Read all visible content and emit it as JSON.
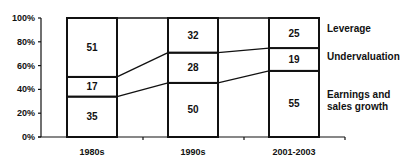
{
  "chart_data": {
    "type": "bar",
    "stacked": true,
    "percent": true,
    "title": "",
    "xlabel": "",
    "ylabel": "",
    "ylim": [
      0,
      100
    ],
    "yticks": [
      "0%",
      "20%",
      "40%",
      "60%",
      "80%",
      "100%"
    ],
    "categories": [
      "1980s",
      "1990s",
      "2001-2003"
    ],
    "series": [
      {
        "name": "Earnings and sales growth",
        "values": [
          35,
          50,
          55
        ]
      },
      {
        "name": "Undervaluation",
        "values": [
          17,
          28,
          19
        ]
      },
      {
        "name": "Leverage",
        "values": [
          51,
          32,
          25
        ]
      }
    ],
    "series_lines": true,
    "legend_position": "right",
    "legend": [
      "Leverage",
      "Undervaluation",
      "Earnings and sales growth"
    ],
    "legend_lines": [
      [
        "Leverage"
      ],
      [
        "Undervaluation"
      ],
      [
        "Earnings and",
        "sales growth"
      ]
    ],
    "colors": {
      "fill": "#ffffff",
      "stroke": "#111111"
    }
  }
}
